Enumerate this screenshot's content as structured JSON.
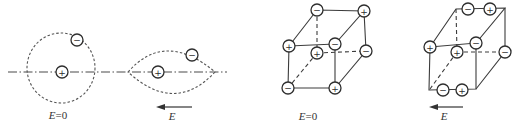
{
  "figure": {
    "panels": [
      {
        "name": "isolated-atom-no-field",
        "label": {
          "var": "E",
          "value": "=0"
        },
        "charges": [
          {
            "role": "nucleus",
            "sign": "+"
          },
          {
            "role": "electron",
            "sign": "−"
          }
        ]
      },
      {
        "name": "polarized-atom-in-field",
        "label": {
          "var": "E",
          "value": ""
        },
        "field_direction": "left",
        "charges": [
          {
            "role": "nucleus",
            "sign": "+"
          },
          {
            "role": "electron",
            "sign": "−"
          }
        ]
      },
      {
        "name": "ionic-crystal-no-field",
        "label": {
          "var": "E",
          "value": "=0"
        },
        "charges": [
          {
            "vertex": "front-top-left",
            "sign": "+"
          },
          {
            "vertex": "front-top-right",
            "sign": "−"
          },
          {
            "vertex": "front-bottom-right",
            "sign": "+"
          },
          {
            "vertex": "front-bottom-left",
            "sign": "−"
          },
          {
            "vertex": "back-top-left",
            "sign": "−"
          },
          {
            "vertex": "back-top-right",
            "sign": "+"
          },
          {
            "vertex": "back-bottom-right",
            "sign": "−"
          },
          {
            "vertex": "back-bottom-left",
            "sign": "+"
          }
        ]
      },
      {
        "name": "ionic-crystal-in-field",
        "label": {
          "var": "E",
          "value": ""
        },
        "field_direction": "left",
        "charges": [
          {
            "vertex": "front-top-left",
            "sign": "+"
          },
          {
            "vertex": "front-top-right",
            "sign": "−"
          },
          {
            "vertex": "back-bottom-right",
            "sign": "−"
          },
          {
            "vertex": "back-bottom-left",
            "sign": "+"
          },
          {
            "vertex": "back-top-edge-left",
            "sign": "−"
          },
          {
            "vertex": "back-top-edge-right",
            "sign": "+"
          },
          {
            "vertex": "front-bottom-edge-left",
            "sign": "−"
          },
          {
            "vertex": "front-bottom-edge-right",
            "sign": "+"
          }
        ]
      }
    ]
  }
}
